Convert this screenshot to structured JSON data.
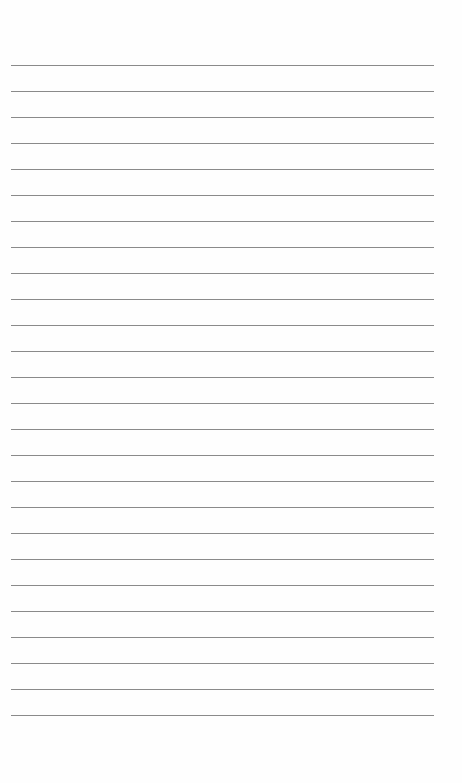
{
  "page": {
    "type": "lined-paper",
    "background": "#fefefe",
    "line_color": "#8a8a8a",
    "line_count": 26,
    "first_line_y": 65,
    "line_spacing": 26,
    "line_left": 11,
    "line_width": 423
  }
}
